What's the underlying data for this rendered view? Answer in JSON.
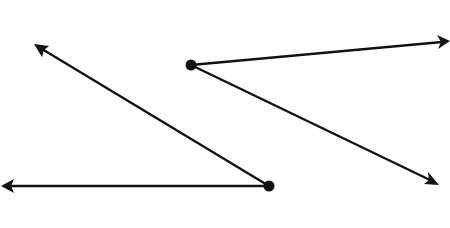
{
  "diagram": {
    "type": "geometry-angles",
    "stroke_color": "#111111",
    "background_color": "#ffffff",
    "labels_visible": false,
    "angles": [
      {
        "id": "angle-1",
        "description": "obtuse angle, vertex at lower right, one ray pointing left, one ray pointing up-left",
        "vertex": "vertex-1",
        "rays": [
          {
            "id": "ray-1a",
            "direction": "left",
            "arrow": true
          },
          {
            "id": "ray-1b",
            "direction": "up-left",
            "arrow": true
          }
        ]
      },
      {
        "id": "angle-2",
        "description": "acute angle, vertex at upper left, one ray pointing right (slightly up), one ray pointing down-right",
        "vertex": "vertex-2",
        "rays": [
          {
            "id": "ray-2a",
            "direction": "right",
            "arrow": true
          },
          {
            "id": "ray-2b",
            "direction": "down-right",
            "arrow": true
          }
        ]
      }
    ]
  }
}
